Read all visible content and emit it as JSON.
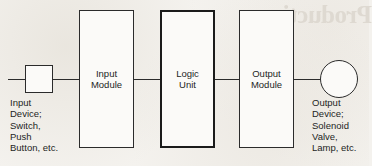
{
  "diagram": {
    "background_color": "#f4f2ee",
    "line_color": "#2b2b2b",
    "bleed_through_text": "Production",
    "nodes": [
      {
        "name": "input-device-symbol",
        "label": "",
        "shape": "square",
        "x": 25,
        "y": 65,
        "width": 28,
        "height": 28,
        "border_width": 1
      },
      {
        "name": "input-module",
        "label": "Input\nModule",
        "shape": "rectangle",
        "x": 79,
        "y": 10,
        "width": 55,
        "height": 138,
        "border_width": 1
      },
      {
        "name": "logic-unit",
        "label": "Logic\nUnit",
        "shape": "rectangle",
        "x": 160,
        "y": 10,
        "width": 55,
        "height": 138,
        "border_width": 2
      },
      {
        "name": "output-module",
        "label": "Output\nModule",
        "shape": "rectangle",
        "x": 239,
        "y": 10,
        "width": 55,
        "height": 138,
        "border_width": 1
      },
      {
        "name": "output-device-symbol",
        "label": "",
        "shape": "circle",
        "x": 320,
        "y": 60,
        "width": 38,
        "height": 38,
        "border_width": 1.6
      }
    ],
    "connectors": [
      {
        "name": "connector-line-start",
        "x": 8,
        "y": 79,
        "length": 18
      },
      {
        "name": "connector-input-to-module",
        "x": 53,
        "y": 79,
        "length": 27
      },
      {
        "name": "connector-module-to-logic",
        "x": 134,
        "y": 79,
        "length": 27
      },
      {
        "name": "connector-logic-to-output",
        "x": 215,
        "y": 79,
        "length": 25
      },
      {
        "name": "connector-output-to-device",
        "x": 294,
        "y": 79,
        "length": 27
      }
    ],
    "captions": [
      {
        "name": "input-device-caption",
        "text": "Input\nDevice;\nSwitch,\nPush\nButton, etc.",
        "x": 10,
        "y": 97
      },
      {
        "name": "output-device-caption",
        "text": "Output\nDevice;\nSolenoid\nValve,\nLamp, etc.",
        "x": 312,
        "y": 97
      }
    ]
  }
}
